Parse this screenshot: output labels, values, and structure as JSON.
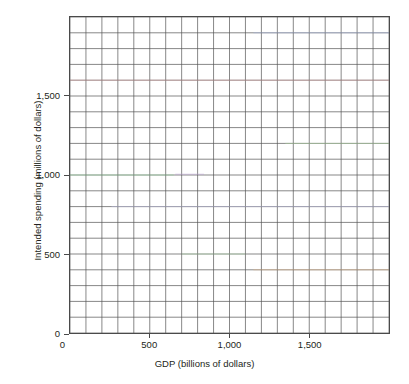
{
  "chart_data": {
    "type": "line",
    "title": "",
    "subtitle": "",
    "xlabel": "GDP (billions of dollars)",
    "ylabel": "Intended spending (millions of dollars)",
    "xlim": [
      0,
      2000
    ],
    "ylim": [
      0,
      2000
    ],
    "xticks": [
      0,
      500,
      1000,
      1500
    ],
    "yticks": [
      0,
      500,
      1000,
      1500
    ],
    "xtick_labels": [
      "0",
      "500",
      "1,000",
      "1,500"
    ],
    "ytick_labels": [
      "0",
      "500",
      "1,000",
      "1,500"
    ],
    "grid": true,
    "grid_x_step": 100,
    "grid_y_step": 100,
    "grid_color": "#555555",
    "legend": "none",
    "annotations": [],
    "series": [
      {
        "name": "trace-1000",
        "color": "#8fd49a",
        "x": [
          0,
          650
        ],
        "values": [
          1000,
          1000
        ]
      },
      {
        "name": "trace-1000-b",
        "color": "#b9a0d4",
        "x": [
          660,
          840
        ],
        "values": [
          1005,
          1005
        ]
      },
      {
        "name": "trace-1600",
        "color": "#d9a2a2",
        "x": [
          0,
          2000
        ],
        "values": [
          1600,
          1600
        ]
      },
      {
        "name": "trace-1900",
        "color": "#a6b4de",
        "x": [
          1150,
          2000
        ],
        "values": [
          1900,
          1900
        ]
      },
      {
        "name": "trace-1200",
        "color": "#a8cf9d",
        "x": [
          1350,
          2000
        ],
        "values": [
          1200,
          1200
        ]
      },
      {
        "name": "trace-800",
        "color": "#b7b7d8",
        "x": [
          260,
          2000
        ],
        "values": [
          800,
          800
        ]
      },
      {
        "name": "trace-500",
        "color": "#a9d4a4",
        "x": [
          700,
          1100
        ],
        "values": [
          500,
          500
        ]
      },
      {
        "name": "trace-400",
        "color": "#e0b489",
        "x": [
          1150,
          2000
        ],
        "values": [
          400,
          400
        ]
      }
    ]
  },
  "axes": {
    "x_title": "GDP (billions of dollars)",
    "y_title": "Intended spending (millions of dollars)",
    "x_tick_labels": [
      "0",
      "500",
      "1,000",
      "1,500"
    ],
    "y_tick_labels": [
      "0",
      "500",
      "1,000",
      "1,500"
    ]
  }
}
